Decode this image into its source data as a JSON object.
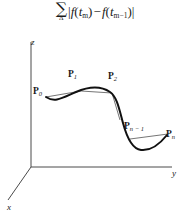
{
  "figure": {
    "name": "variation-sum-3d-curve-figure",
    "formula": {
      "sigma": "∑",
      "sigma_sub": "Δ",
      "open_bar": "|",
      "f1": "f",
      "lparen1": "(",
      "t1": "t",
      "t1_sub": "m",
      "rparen1": ")",
      "minus": "−",
      "f2": "f",
      "lparen2": "(",
      "t2": "t",
      "t2_sub": "m−1",
      "rparen2": ")",
      "close_bar": "|",
      "plain_text": "∑_Δ |f(t_m) − f(t_m−1)|"
    },
    "axes": {
      "z_label": "z",
      "y_label": "y",
      "x_label": "x",
      "origin": [
        31,
        137
      ],
      "z_tip": [
        31,
        12
      ],
      "y_tip": [
        172,
        137
      ],
      "x_tip": [
        8,
        170
      ],
      "stroke_color": "#4a4a4a"
    },
    "curve": {
      "color": "#111111",
      "stroke_width": 2,
      "shape": "sigmoid-s-curve",
      "path": "M 46,67 C 56,74 62,69 76,63 C 90,57 100,57 110,62 C 118,66 120,76 124,92 C 128,108 132,118 141,120 C 150,122 158,116 166,106"
    },
    "chords": [
      {
        "name": "chord-p0-p1",
        "from": [
          46,
          67
        ],
        "to": [
          81,
          61
        ]
      },
      {
        "name": "chord-p1-p2",
        "from": [
          81,
          61
        ],
        "to": [
          112,
          63
        ]
      },
      {
        "name": "chord-p2-pmid",
        "from": [
          112,
          63
        ],
        "to": [
          120,
          88
        ]
      },
      {
        "name": "chord-pnminus1-pn",
        "from": [
          131,
          110
        ],
        "to": [
          168,
          104
        ]
      }
    ],
    "points": [
      {
        "name": "point-label-p0",
        "letter": "P",
        "sub": "0",
        "x": 33,
        "y": 57
      },
      {
        "name": "point-label-p1",
        "letter": "P",
        "sub": "1",
        "x": 68,
        "y": 40
      },
      {
        "name": "point-label-p2",
        "letter": "P",
        "sub": "2",
        "x": 108,
        "y": 42
      },
      {
        "name": "point-label-pn-1",
        "letter": "P",
        "sub": "n − 1",
        "x": 124,
        "y": 92
      },
      {
        "name": "point-label-pn",
        "letter": "P",
        "sub": "n",
        "x": 166,
        "y": 100
      }
    ]
  }
}
